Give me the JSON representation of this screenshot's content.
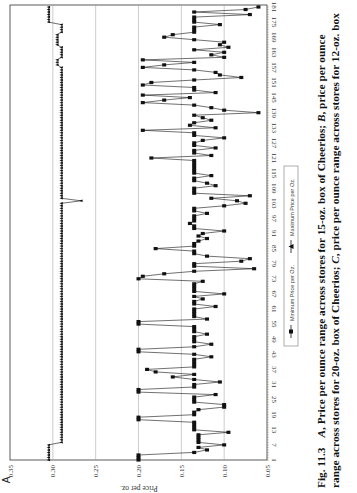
{
  "panel_label": "A",
  "caption": {
    "line1_a": "Fig. 11.3",
    "line1_b": "A",
    "line1_c": ", Price per ounce range across stores for 15-oz. box of Cheerios; ",
    "line1_d": "B",
    "line1_e": ", price per ounce",
    "line2_a": "range across stores for 20-oz. box of Cheerios; ",
    "line2_b": "C",
    "line2_c": ", price per ounce range across stores for 12-oz. box"
  },
  "chart_data": {
    "type": "line",
    "orientation": "rotated 90 degrees clockwise (weeks run bottom-to-top, price runs left-to-right decreasing)",
    "title": "",
    "xlabel": "Weeks",
    "ylabel": "Price per oz.",
    "ylim": [
      0.05,
      0.35
    ],
    "y_ticks": [
      "0.35",
      "0.30",
      "0.25",
      "0.20",
      "0.15",
      "0.10",
      "0.05"
    ],
    "x_ticks": [
      "1",
      "7",
      "13",
      "19",
      "25",
      "31",
      "37",
      "43",
      "49",
      "55",
      "61",
      "67",
      "73",
      "79",
      "85",
      "91",
      "97",
      "103",
      "109",
      "115",
      "121",
      "127",
      "133",
      "139",
      "145",
      "151",
      "157",
      "163",
      "169",
      "175",
      "181"
    ],
    "grid": "horizontal gridlines at each price tick",
    "legend": [
      "Minimum Price per Oz.",
      "Maximum Price per Oz."
    ],
    "series": [
      {
        "name": "Minimum Price per Oz.",
        "marker": "square",
        "x_range": [
          1,
          181
        ],
        "approx_values_by_week": {
          "1": 0.2,
          "2": 0.2,
          "3": 0.2,
          "4": 0.135,
          "5": 0.12,
          "6": 0.13,
          "7": 0.1,
          "8": 0.13,
          "9": 0.13,
          "10": 0.13,
          "11": 0.13,
          "12": 0.095,
          "13": 0.135,
          "14": 0.135,
          "15": 0.135,
          "16": 0.135,
          "17": 0.2,
          "18": 0.2,
          "19": 0.135,
          "20": 0.135,
          "21": 0.13,
          "22": 0.1,
          "23": 0.1,
          "24": 0.135,
          "25": 0.135,
          "26": 0.135,
          "27": 0.11,
          "28": 0.2,
          "29": 0.2,
          "30": 0.135,
          "31": 0.135,
          "32": 0.105,
          "33": 0.135,
          "34": 0.16,
          "35": 0.135,
          "36": 0.18,
          "37": 0.19,
          "38": 0.135,
          "39": 0.135,
          "40": 0.135,
          "41": 0.135,
          "42": 0.115,
          "43": 0.135,
          "44": 0.2,
          "45": 0.2,
          "46": 0.135,
          "47": 0.115,
          "48": 0.135,
          "49": 0.135,
          "50": 0.135,
          "51": 0.12,
          "52": 0.135,
          "53": 0.135,
          "54": 0.135,
          "55": 0.2,
          "56": 0.2,
          "57": 0.12,
          "58": 0.135,
          "59": 0.135,
          "60": 0.135,
          "61": 0.135,
          "62": 0.11,
          "63": 0.135,
          "64": 0.135,
          "65": 0.125,
          "66": 0.135,
          "67": 0.1,
          "68": 0.135,
          "69": 0.135,
          "70": 0.135,
          "71": 0.135,
          "72": 0.125,
          "73": 0.2,
          "74": 0.195,
          "75": 0.17,
          "76": 0.135,
          "77": 0.065,
          "78": 0.135,
          "79": 0.135,
          "80": 0.08,
          "81": 0.07,
          "82": 0.12,
          "83": 0.135,
          "84": 0.135,
          "85": 0.18,
          "86": 0.135,
          "87": 0.135,
          "88": 0.13,
          "89": 0.12,
          "90": 0.13,
          "91": 0.125,
          "92": 0.1,
          "93": 0.135,
          "94": 0.135,
          "95": 0.14,
          "96": 0.135,
          "97": 0.135,
          "98": 0.135,
          "99": 0.12,
          "100": 0.135,
          "101": 0.135,
          "102": 0.1,
          "103": 0.075,
          "104": 0.085,
          "105": 0.115,
          "106": 0.07,
          "107": 0.135,
          "108": 0.135,
          "109": 0.135,
          "110": 0.11,
          "111": 0.12,
          "112": 0.135,
          "113": 0.135,
          "114": 0.115,
          "115": 0.135,
          "116": 0.135,
          "117": 0.135,
          "118": 0.135,
          "119": 0.135,
          "120": 0.135,
          "121": 0.185,
          "122": 0.115,
          "123": 0.135,
          "124": 0.135,
          "125": 0.11,
          "126": 0.135,
          "127": 0.135,
          "128": 0.125,
          "129": 0.1,
          "130": 0.135,
          "131": 0.135,
          "132": 0.195,
          "133": 0.11,
          "134": 0.14,
          "135": 0.135,
          "136": 0.115,
          "137": 0.125,
          "138": 0.135,
          "139": 0.06,
          "140": 0.1,
          "141": 0.115,
          "142": 0.135,
          "143": 0.195,
          "144": 0.17,
          "145": 0.14,
          "146": 0.195,
          "147": 0.11,
          "148": 0.135,
          "149": 0.135,
          "150": 0.195,
          "151": 0.185,
          "152": 0.135,
          "153": 0.08,
          "154": 0.105,
          "155": 0.11,
          "156": 0.135,
          "157": 0.195,
          "158": 0.17,
          "159": 0.135,
          "160": 0.195,
          "161": 0.1,
          "162": 0.115,
          "163": 0.1,
          "164": 0.135,
          "165": 0.095,
          "166": 0.105,
          "167": 0.1,
          "168": 0.135,
          "169": 0.17,
          "170": 0.16,
          "171": 0.135,
          "172": 0.135,
          "173": 0.135,
          "174": 0.105,
          "175": 0.135,
          "176": 0.135,
          "177": 0.135,
          "178": 0.07,
          "179": 0.135,
          "180": 0.075,
          "181": 0.06
        }
      },
      {
        "name": "Maximum Price per Oz.",
        "marker": "triangle",
        "x_range": [
          1,
          181
        ],
        "approx_description": "~0.305 weeks 1-7, ~0.29 weeks 8-157 (single dip to ~0.267 near week 104), stepping 0.295-0.305 weeks 158-181",
        "approx_values_by_segment": [
          {
            "weeks": [
              1,
              7
            ],
            "value": 0.305
          },
          {
            "weeks": [
              8,
              103
            ],
            "value": 0.29
          },
          {
            "weeks": [
              104,
              104
            ],
            "value": 0.267
          },
          {
            "weeks": [
              105,
              157
            ],
            "value": 0.29
          },
          {
            "weeks": [
              158,
              160
            ],
            "value": 0.295
          },
          {
            "weeks": [
              161,
              165
            ],
            "value": 0.29
          },
          {
            "weeks": [
              166,
              170
            ],
            "value": 0.295
          },
          {
            "weeks": [
              171,
              174
            ],
            "value": 0.29
          },
          {
            "weeks": [
              175,
              181
            ],
            "value": 0.305
          }
        ]
      }
    ]
  }
}
